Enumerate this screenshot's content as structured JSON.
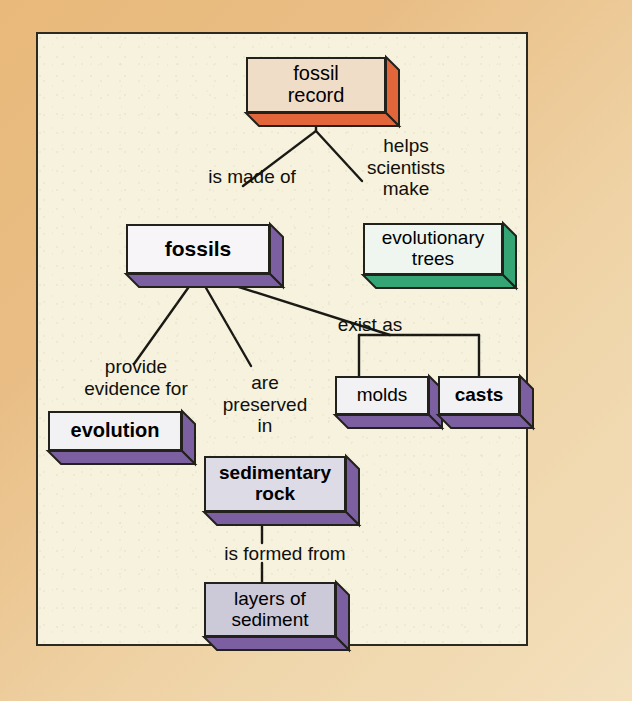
{
  "diagram": {
    "type": "concept-map",
    "canvas": {
      "background": "#f6f2de",
      "border_color": "#2b2a20"
    },
    "frame_color": "#e8b97a",
    "nodes": [
      {
        "id": "fossil-record",
        "label": "fossil\nrecord",
        "bold": false,
        "face_color": "#f0ddc8",
        "side_color": "#e2663a",
        "bottom_color": "#e2663a",
        "x": 208,
        "y": 23,
        "w": 140,
        "h": 56,
        "depth": 13
      },
      {
        "id": "fossils",
        "label": "fossils",
        "bold": true,
        "face_color": "#f7f5f8",
        "side_color": "#7b5fa0",
        "bottom_color": "#7b5fa0",
        "x": 88,
        "y": 190,
        "w": 144,
        "h": 50,
        "depth": 13
      },
      {
        "id": "evolutionary-trees",
        "label": "evolutionary\ntrees",
        "bold": false,
        "face_color": "#eef6ef",
        "side_color": "#36a576",
        "bottom_color": "#36a576",
        "x": 325,
        "y": 189,
        "w": 140,
        "h": 52,
        "depth": 13
      },
      {
        "id": "evolution",
        "label": "evolution",
        "bold": true,
        "face_color": "#f2f1f4",
        "side_color": "#7b5fa0",
        "bottom_color": "#7b5fa0",
        "x": 10,
        "y": 377,
        "w": 134,
        "h": 40,
        "depth": 13
      },
      {
        "id": "molds",
        "label": "molds",
        "bold": false,
        "face_color": "#f2f1f4",
        "side_color": "#7b5fa0",
        "bottom_color": "#7b5fa0",
        "x": 297,
        "y": 342,
        "w": 94,
        "h": 39,
        "depth": 13
      },
      {
        "id": "casts",
        "label": "casts",
        "bold": true,
        "face_color": "#f2f1f4",
        "side_color": "#7b5fa0",
        "bottom_color": "#7b5fa0",
        "x": 400,
        "y": 342,
        "w": 82,
        "h": 39,
        "depth": 13
      },
      {
        "id": "sedimentary-rock",
        "label": "sedimentary\nrock",
        "bold": true,
        "face_color": "#dddbe6",
        "side_color": "#7b5fa0",
        "bottom_color": "#7b5fa0",
        "x": 166,
        "y": 422,
        "w": 142,
        "h": 56,
        "depth": 13
      },
      {
        "id": "layers-of-sediment",
        "label": "layers of\nsediment",
        "bold": false,
        "face_color": "#ccc9d8",
        "side_color": "#7b5fa0",
        "bottom_color": "#7b5fa0",
        "x": 166,
        "y": 548,
        "w": 132,
        "h": 55,
        "depth": 13
      }
    ],
    "edge_labels": [
      {
        "id": "is-made-of",
        "text": "is made of",
        "x": 154,
        "y": 132,
        "w": 120
      },
      {
        "id": "helps-scientists-make",
        "text": "helps\nscientists\nmake",
        "x": 313,
        "y": 101,
        "w": 110
      },
      {
        "id": "provide-evidence-for",
        "text": "provide\nevidence for",
        "x": 28,
        "y": 322,
        "w": 140
      },
      {
        "id": "are-preserved-in",
        "text": "are\npreserved\nin",
        "x": 172,
        "y": 338,
        "w": 110
      },
      {
        "id": "exist-as",
        "text": "exist as",
        "x": 282,
        "y": 280,
        "w": 100
      },
      {
        "id": "is-formed-from",
        "text": "is formed from",
        "x": 162,
        "y": 509,
        "w": 170
      }
    ],
    "connectors": [
      {
        "id": "record-to-fossils",
        "from": "fossil-record",
        "to": "fossils"
      },
      {
        "id": "record-to-trees",
        "from": "fossil-record",
        "to": "evolutionary-trees"
      },
      {
        "id": "fossils-to-evolution",
        "from": "fossils",
        "to": "evolution"
      },
      {
        "id": "fossils-to-sedimentary",
        "from": "fossils",
        "to": "sedimentary-rock"
      },
      {
        "id": "fossils-to-exist-as",
        "from": "fossils",
        "to": "molds-casts-bracket"
      },
      {
        "id": "bracket-to-molds",
        "from": "molds-casts-bracket",
        "to": "molds"
      },
      {
        "id": "bracket-to-casts",
        "from": "molds-casts-bracket",
        "to": "casts"
      },
      {
        "id": "sedimentary-to-layers",
        "from": "sedimentary-rock",
        "to": "layers-of-sediment"
      }
    ]
  }
}
